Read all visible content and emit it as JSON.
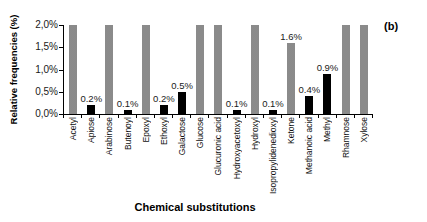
{
  "panel_label": "(b)",
  "colors": {
    "solid_bar": "#000000",
    "dotted_bar_dot": "#4a4a4a",
    "axis": "#000000",
    "background": "#ffffff"
  },
  "chart_data": {
    "type": "bar",
    "title": "",
    "xlabel": "Chemical substitutions",
    "ylabel": "Relative frequencies (%)",
    "ylim": [
      0,
      2.0
    ],
    "grid": false,
    "legend": "none",
    "yticks": {
      "values": [
        0,
        0.5,
        1.0,
        1.5,
        2.0
      ],
      "labels": [
        "0,0%",
        "0,5%",
        "1,0%",
        "1,5%",
        "2,0%"
      ]
    },
    "categories": [
      "Acetyl",
      "Apiose",
      "Arabinose",
      "Butenoyl",
      "Epoxyl",
      "Ethoxyl",
      "Galactose",
      "Glucose",
      "Glucuronic acid",
      "Hydroxyacetoxyl",
      "Hydroxyl",
      "Isopropylidenedioxyl",
      "Ketone",
      "Methanoic acid",
      "Methyl",
      "Rhamnose",
      "Xylose"
    ],
    "bars": [
      {
        "category": "Acetyl",
        "value": 2.0,
        "style": "dotted",
        "label": ""
      },
      {
        "category": "Apiose",
        "value": 0.2,
        "style": "solid",
        "label": "0.2%"
      },
      {
        "category": "Arabinose",
        "value": 2.0,
        "style": "dotted",
        "label": ""
      },
      {
        "category": "Butenoyl",
        "value": 0.1,
        "style": "solid",
        "label": "0.1%"
      },
      {
        "category": "Epoxyl",
        "value": 2.0,
        "style": "dotted",
        "label": ""
      },
      {
        "category": "Ethoxyl",
        "value": 0.2,
        "style": "solid",
        "label": "0.2%"
      },
      {
        "category": "Galactose",
        "value": 0.5,
        "style": "solid",
        "label": "0.5%"
      },
      {
        "category": "Glucose",
        "value": 2.0,
        "style": "dotted",
        "label": ""
      },
      {
        "category": "Glucuronic acid",
        "value": 2.0,
        "style": "dotted",
        "label": ""
      },
      {
        "category": "Hydroxyacetoxyl",
        "value": 0.1,
        "style": "solid",
        "label": "0.1%"
      },
      {
        "category": "Hydroxyl",
        "value": 2.0,
        "style": "dotted",
        "label": ""
      },
      {
        "category": "Isopropylidenedioxyl",
        "value": 0.1,
        "style": "solid",
        "label": "0.1%"
      },
      {
        "category": "Ketone",
        "value": 1.6,
        "style": "dotted",
        "label": "1.6%"
      },
      {
        "category": "Methanoic acid",
        "value": 0.4,
        "style": "solid",
        "label": "0.4%"
      },
      {
        "category": "Methyl",
        "value": 0.9,
        "style": "solid",
        "label": "0.9%"
      },
      {
        "category": "Rhamnose",
        "value": 2.0,
        "style": "dotted",
        "label": ""
      },
      {
        "category": "Xylose",
        "value": 2.0,
        "style": "dotted",
        "label": ""
      }
    ]
  }
}
